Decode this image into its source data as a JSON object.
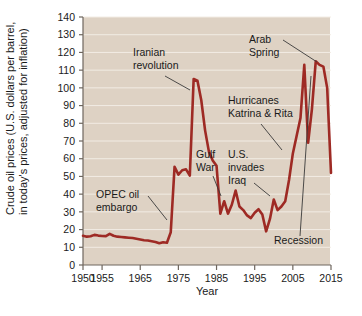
{
  "chart_data": {
    "type": "line",
    "title": "",
    "xlabel": "Year",
    "ylabel": "Crude oil prices (U.S. dollars per barrel, in today's prices, adjusted for inflation)",
    "ylabel_line1": "Crude oil prices (U.S. dollars per barrel,",
    "ylabel_line2": "in today's prices, adjusted for inflation)",
    "xlim": [
      1950,
      2015
    ],
    "ylim": [
      0,
      140
    ],
    "grid": true,
    "legend": "none",
    "line_color": "#9e2a24",
    "plot_background": "#ded2c4",
    "gridline_color": "#f2ece4",
    "xticks": [
      1950,
      1955,
      1965,
      1975,
      1985,
      1995,
      2005,
      2015
    ],
    "xtick_labels": [
      "1950",
      "1955",
      "1965",
      "1975",
      "1985",
      "1995",
      "2005",
      "2015"
    ],
    "yticks": [
      0,
      10,
      20,
      30,
      40,
      50,
      60,
      70,
      80,
      90,
      100,
      110,
      120,
      130,
      140
    ],
    "ytick_labels": [
      "0",
      "10",
      "20",
      "30",
      "40",
      "50",
      "60",
      "70",
      "80",
      "90",
      "100",
      "110",
      "120",
      "130",
      "140"
    ],
    "x": [
      1950,
      1951,
      1952,
      1953,
      1954,
      1955,
      1956,
      1957,
      1958,
      1959,
      1960,
      1961,
      1962,
      1963,
      1964,
      1965,
      1966,
      1967,
      1968,
      1969,
      1970,
      1971,
      1972,
      1973,
      1974,
      1975,
      1976,
      1977,
      1978,
      1979,
      1980,
      1981,
      1982,
      1983,
      1984,
      1985,
      1986,
      1987,
      1988,
      1989,
      1990,
      1991,
      1992,
      1993,
      1994,
      1995,
      1996,
      1997,
      1998,
      1999,
      2000,
      2001,
      2002,
      2003,
      2004,
      2005,
      2006,
      2007,
      2008,
      2009,
      2010,
      2011,
      2012,
      2013,
      2014,
      2015
    ],
    "values": [
      16.5,
      16.0,
      16.2,
      17.0,
      16.6,
      16.4,
      16.3,
      17.6,
      16.5,
      16.0,
      15.8,
      15.6,
      15.4,
      15.2,
      14.8,
      14.4,
      14.0,
      13.8,
      13.4,
      13.0,
      12.3,
      12.8,
      12.6,
      18.5,
      55.5,
      51.0,
      53.5,
      54.0,
      50.5,
      105.0,
      104.0,
      93.0,
      76.0,
      64.0,
      59.0,
      56.0,
      29.0,
      36.0,
      29.0,
      34.0,
      42.0,
      33.0,
      31.0,
      28.0,
      26.5,
      29.5,
      31.5,
      28.5,
      19.0,
      26.0,
      37.0,
      31.0,
      33.0,
      36.0,
      48.0,
      63.0,
      73.0,
      83.0,
      113.0,
      69.0,
      88.0,
      115.0,
      113.0,
      112.0,
      100.0,
      52.0
    ],
    "annotations": [
      {
        "label": "Iranian revolution",
        "lines": [
          "Iranian",
          "revolution"
        ]
      },
      {
        "label": "OPEC oil embargo",
        "lines": [
          "OPEC oil",
          "embargo"
        ]
      },
      {
        "label": "Gulf War",
        "lines": [
          "Gulf",
          "War"
        ]
      },
      {
        "label": "U.S. invades Iraq",
        "lines": [
          "U.S.",
          "invades",
          "Iraq"
        ]
      },
      {
        "label": "Hurricanes Katrina & Rita",
        "lines": [
          "Hurricanes",
          "Katrina & Rita"
        ]
      },
      {
        "label": "Arab Spring",
        "lines": [
          "Arab",
          "Spring"
        ]
      },
      {
        "label": "Recession",
        "lines": [
          "Recession"
        ]
      }
    ]
  }
}
